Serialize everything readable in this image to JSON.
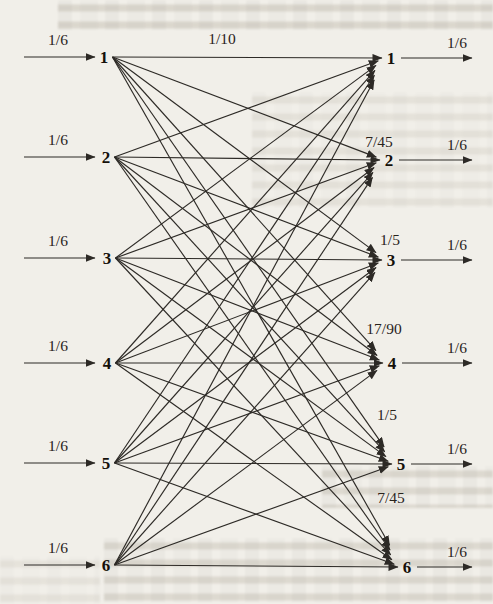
{
  "diagram": {
    "type": "channel-transition-diagram",
    "structure": "complete bipartite, every left node has an arrow to every right node",
    "left_nodes": [
      {
        "label": "1",
        "x": 104,
        "y": 57,
        "input_label": "1/6"
      },
      {
        "label": "2",
        "x": 106,
        "y": 157,
        "input_label": "1/6"
      },
      {
        "label": "3",
        "x": 107,
        "y": 258,
        "input_label": "1/6"
      },
      {
        "label": "4",
        "x": 107,
        "y": 363,
        "input_label": "1/6"
      },
      {
        "label": "5",
        "x": 106,
        "y": 463,
        "input_label": "1/6"
      },
      {
        "label": "6",
        "x": 106,
        "y": 565,
        "input_label": "1/6"
      }
    ],
    "right_nodes": [
      {
        "label": "1",
        "x": 391,
        "y": 58,
        "output_label": "1/6"
      },
      {
        "label": "2",
        "x": 389,
        "y": 160,
        "output_label": "1/6"
      },
      {
        "label": "3",
        "x": 391,
        "y": 260,
        "output_label": "1/6"
      },
      {
        "label": "4",
        "x": 392,
        "y": 363,
        "output_label": "1/6"
      },
      {
        "label": "5",
        "x": 401,
        "y": 464,
        "output_label": "1/6"
      },
      {
        "label": "6",
        "x": 407,
        "y": 567,
        "output_label": "1/6"
      }
    ],
    "edge_labels": [
      {
        "text": "1/10",
        "x": 222,
        "y": 39
      },
      {
        "text": "7/45",
        "x": 379,
        "y": 142
      },
      {
        "text": "1/5",
        "x": 390,
        "y": 240
      },
      {
        "text": "17/90",
        "x": 384,
        "y": 329
      },
      {
        "text": "1/5",
        "x": 387,
        "y": 415
      },
      {
        "text": "7/45",
        "x": 391,
        "y": 498
      }
    ],
    "colors": {
      "line": "#2d2a26",
      "digit": "#151009",
      "label": "#29231b",
      "paper": "#f1efe9"
    }
  }
}
